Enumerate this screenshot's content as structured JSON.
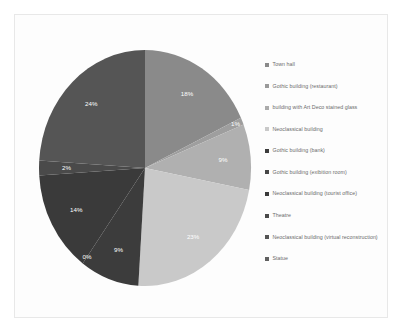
{
  "chart_data": {
    "type": "pie",
    "title": "",
    "legend_position": "right",
    "labels": [
      "Town hall",
      "Gothic building (restaurant)",
      "building with Art Deco stained glass",
      "Neoclassical building",
      "Gothic building (bank)",
      "Gothic building (exibition room)",
      "Neoclassical building (tourist office)",
      "Theatre",
      "Neoclassical building (virtual reconstruction)",
      "Statue"
    ],
    "slices": [
      {
        "label": "Town hall",
        "percent_label": "18%",
        "value": 18,
        "color": "#8a8a8a"
      },
      {
        "label": "Gothic building (restaurant)",
        "percent_label": "1%",
        "value": 1,
        "color": "#9e9e9e"
      },
      {
        "label": "building with Art Deco stained glass",
        "percent_label": "9%",
        "value": 9,
        "color": "#b0b0b0"
      },
      {
        "label": "Neoclassical building",
        "percent_label": "23%",
        "value": 23,
        "color": "#c9c9c9"
      },
      {
        "label": "Gothic building (bank)",
        "percent_label": "9%",
        "value": 9,
        "color": "#3c3c3c"
      },
      {
        "label": "Gothic building (exibition room)",
        "percent_label": "0%",
        "value": 0,
        "color": "#444444"
      },
      {
        "label": "Neoclassical building (tourist office)",
        "percent_label": "14%",
        "value": 14,
        "color": "#3a3a3a"
      },
      {
        "label": "Theatre",
        "percent_label": "2%",
        "value": 2,
        "color": "#4a4a4a"
      },
      {
        "label": "Neoclassical building (virtual reconstruction)",
        "percent_label": "24%",
        "value": 24,
        "color": "#555555"
      },
      {
        "label": "Statue",
        "percent_label": "",
        "value": 0,
        "color": "#5f5f5f"
      }
    ],
    "legend_entries": [
      {
        "label": "Town hall",
        "color": "#8a8a8a"
      },
      {
        "label": "Gothic building (restaurant)",
        "color": "#9a9a9a"
      },
      {
        "label": "building with Art Deco stained glass",
        "color": "#ababab"
      },
      {
        "label": "Neoclassical building",
        "color": "#c9c9c9"
      },
      {
        "label": "Gothic building (bank)",
        "color": "#3c3c3c"
      },
      {
        "label": "Gothic building (exibition room)",
        "color": "#474747"
      },
      {
        "label": "Neoclassical building (tourist office)",
        "color": "#3a3a3a"
      },
      {
        "label": "Theatre",
        "color": "#4a4a4a"
      },
      {
        "label": "Neoclassical building (virtual reconstruction)",
        "color": "#555555"
      },
      {
        "label": "Statue",
        "color": "#606060"
      }
    ]
  }
}
